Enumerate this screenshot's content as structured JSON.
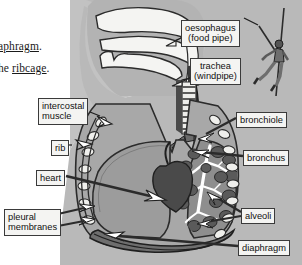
{
  "figure": {
    "type": "labelled anatomical diagram",
    "palette": {
      "page_background": "#ffffff",
      "body_silhouette": "#b9b9b9",
      "torso_cavity": "#a8a8a8",
      "lung_left_fill": "#9a9a9a",
      "lung_right_fill": "#8e8e8e",
      "heart_fill": "#4a4a4a",
      "alveoli_fill": "#5d5d5d",
      "bronchial_tree": "#ffffff",
      "airway_fill": "#f2f2f0",
      "outline": "#2b2b2b",
      "label_box_fill": "#f4f4f2",
      "label_box_border": "#3a3a3a",
      "arrow_dark": "#2b2b2b",
      "arrow_light": "#ffffff"
    }
  },
  "booktext": {
    "line1": "aphragm.",
    "line1_underlined": "aphragm",
    "line2_prefix": "he ",
    "line2_underlined": "ribcage",
    "line2_suffix": "."
  },
  "labels": [
    {
      "id": "oesophagus",
      "line1": "oesophagus",
      "line2": "(food pipe)",
      "x": 181,
      "y": 20,
      "align": "center"
    },
    {
      "id": "trachea",
      "line1": "trachea",
      "line2": "(windpipe)",
      "x": 190,
      "y": 58,
      "align": "center"
    },
    {
      "id": "intercostal",
      "line1": "intercostal",
      "line2": "muscle",
      "x": 38,
      "y": 98,
      "align": "left"
    },
    {
      "id": "bronchiole",
      "line1": "bronchiole",
      "line2": "",
      "x": 236,
      "y": 112,
      "align": "left"
    },
    {
      "id": "rib",
      "line1": "rib",
      "line2": "",
      "x": 51,
      "y": 140,
      "align": "left"
    },
    {
      "id": "bronchus",
      "line1": "bronchus",
      "line2": "",
      "x": 243,
      "y": 150,
      "align": "left"
    },
    {
      "id": "heart",
      "line1": "heart",
      "line2": "",
      "x": 36,
      "y": 170,
      "align": "left"
    },
    {
      "id": "pleural",
      "line1": "pleural",
      "line2": "membranes",
      "x": 4,
      "y": 209,
      "align": "left"
    },
    {
      "id": "alveoli",
      "line1": "alveoli",
      "line2": "",
      "x": 241,
      "y": 208,
      "align": "left"
    },
    {
      "id": "diaphragm",
      "line1": "diaphragm",
      "line2": "",
      "x": 238,
      "y": 240,
      "align": "left"
    }
  ],
  "icons": {
    "climber": "rock-climber-figure",
    "rope": "climbing-rope"
  },
  "anatomy_parts": [
    "nasal cavity",
    "mouth",
    "tongue",
    "pharynx",
    "larynx",
    "trachea",
    "oesophagus",
    "left lung",
    "right lung",
    "bronchus",
    "bronchiole",
    "alveoli",
    "heart",
    "ribs",
    "intercostal muscle",
    "pleural membranes",
    "diaphragm"
  ]
}
